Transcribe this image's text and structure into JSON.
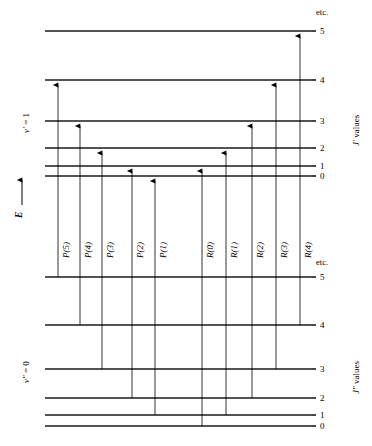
{
  "figure": {
    "axis_label": "E",
    "upper_state": {
      "vib_label": "v' = 1",
      "vib_prime": "v",
      "vib_eq": " = 1",
      "j_values_label": "J' values",
      "j_symbol": "J'",
      "j_values_suffix": " values",
      "etc": "etc.",
      "levels": [
        {
          "j": "0",
          "y": 176
        },
        {
          "j": "1",
          "y": 166
        },
        {
          "j": "2",
          "y": 148
        },
        {
          "j": "3",
          "y": 121
        },
        {
          "j": "4",
          "y": 80
        },
        {
          "j": "5",
          "y": 31
        }
      ]
    },
    "lower_state": {
      "vib_label": "v'' = 0",
      "vib_prime": "v",
      "vib_eq": " = 0",
      "j_values_label": "J'' values",
      "j_symbol": "J''",
      "j_values_suffix": " values",
      "etc": "etc.",
      "levels": [
        {
          "j": "0",
          "y": 426
        },
        {
          "j": "1",
          "y": 415
        },
        {
          "j": "2",
          "y": 398
        },
        {
          "j": "3",
          "y": 369
        },
        {
          "j": "4",
          "y": 325
        },
        {
          "j": "5",
          "y": 277
        }
      ]
    },
    "transitions": [
      {
        "label": "P(5)",
        "branch": "P",
        "x": 58,
        "j_lower": "5",
        "j_upper": "4",
        "y_lower": 277,
        "y_upper": 80
      },
      {
        "label": "P(4)",
        "branch": "P",
        "x": 80,
        "j_lower": "4",
        "j_upper": "3",
        "y_lower": 325,
        "y_upper": 121
      },
      {
        "label": "P(3)",
        "branch": "P",
        "x": 102,
        "j_lower": "3",
        "j_upper": "2",
        "y_lower": 369,
        "y_upper": 148
      },
      {
        "label": "P(2)",
        "branch": "P",
        "x": 132,
        "j_lower": "2",
        "j_upper": "1",
        "y_lower": 398,
        "y_upper": 166
      },
      {
        "label": "P(1)",
        "branch": "P",
        "x": 155,
        "j_lower": "1",
        "j_upper": "0",
        "y_lower": 415,
        "y_upper": 176
      },
      {
        "label": "R(0)",
        "branch": "R",
        "x": 202,
        "j_lower": "0",
        "j_upper": "1",
        "y_lower": 426,
        "y_upper": 166
      },
      {
        "label": "R(1)",
        "branch": "R",
        "x": 226,
        "j_lower": "1",
        "j_upper": "2",
        "y_lower": 415,
        "y_upper": 148
      },
      {
        "label": "R(2)",
        "branch": "R",
        "x": 252,
        "j_lower": "2",
        "j_upper": "3",
        "y_lower": 398,
        "y_upper": 121
      },
      {
        "label": "R(3)",
        "branch": "R",
        "x": 276,
        "j_lower": "3",
        "j_upper": "4",
        "y_lower": 369,
        "y_upper": 80
      },
      {
        "label": "R(4)",
        "branch": "R",
        "x": 300,
        "j_lower": "4",
        "j_upper": "5",
        "y_lower": 325,
        "y_upper": 31
      }
    ],
    "geometry": {
      "level_x_start": 45,
      "level_x_end": 312,
      "label_x": 320,
      "etc_x": 316,
      "branch_label_y": 258,
      "line_color": "#000000",
      "level_color": "#1a1a1a"
    }
  }
}
